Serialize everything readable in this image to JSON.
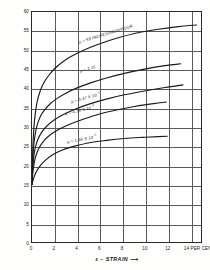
{
  "chart_data": {
    "type": "line",
    "title": "",
    "xlabel": "ε – STRAIN",
    "ylabel": "σ – TRUE STRESS IN THOUSAND LBS/INCH",
    "ylabel_sup": "2",
    "xlabel_arrow": "⟶",
    "ylabel_arrow": "⟶",
    "xlim": [
      0,
      15
    ],
    "ylim": [
      0,
      60
    ],
    "xticks": [
      0,
      2,
      4,
      6,
      8,
      10,
      12,
      14
    ],
    "xtick_labels": [
      "0",
      "2",
      "4",
      "6",
      "8",
      "10",
      "12",
      "14 PER CENT"
    ],
    "yticks": [
      0,
      5,
      10,
      15,
      20,
      25,
      30,
      35,
      40,
      45,
      50,
      55,
      60
    ],
    "ytick_labels": [
      "0",
      "5",
      "10",
      "15",
      "20",
      "25",
      "30",
      "35",
      "40",
      "45",
      "50",
      "55",
      "60"
    ],
    "grid": true,
    "grid_color": "#5a5a5a",
    "curve_color": "#1a1a1a",
    "legend_position": "inline-annotations",
    "series": [
      {
        "name": "mu-59",
        "label": "μ = 59 INCHES/INCH/HOUR",
        "label_x": 4.2,
        "label_y": 52.0,
        "label_rotation": -17,
        "x": [
          0,
          0.05,
          0.12,
          0.25,
          0.45,
          0.75,
          1.1,
          1.5,
          2.0,
          2.6,
          3.3,
          4.2,
          5.2,
          6.4,
          7.8,
          9.4,
          11.2,
          13.0,
          14.6
        ],
        "y": [
          15.0,
          22.0,
          27.5,
          32.5,
          36.5,
          39.6,
          41.8,
          43.5,
          45.2,
          46.7,
          48.1,
          49.5,
          50.8,
          52.1,
          53.4,
          54.6,
          55.5,
          56.2,
          56.6
        ]
      },
      {
        "name": "mu-2.15",
        "label": "μ = 2.15",
        "label_x": 4.3,
        "label_y": 44.4,
        "label_rotation": -16,
        "x": [
          0,
          0.05,
          0.12,
          0.25,
          0.45,
          0.75,
          1.1,
          1.6,
          2.2,
          3.0,
          4.0,
          5.2,
          6.6,
          8.2,
          10.0,
          11.8,
          13.2
        ],
        "y": [
          15.0,
          20.0,
          24.0,
          27.5,
          30.4,
          32.8,
          34.4,
          36.0,
          37.4,
          38.8,
          40.2,
          41.5,
          42.8,
          44.0,
          45.1,
          46.0,
          46.5
        ]
      },
      {
        "name": "mu-0.47e-1",
        "label": "μ = 0.47 X 10",
        "label_sup": "−1",
        "label_x": 3.5,
        "label_y": 36.6,
        "label_rotation": -15,
        "x": [
          0,
          0.05,
          0.12,
          0.25,
          0.5,
          0.85,
          1.3,
          1.9,
          2.7,
          3.7,
          5.0,
          6.5,
          8.2,
          10.0,
          11.8,
          13.4
        ],
        "y": [
          15.0,
          18.4,
          21.2,
          24.0,
          26.6,
          28.6,
          30.2,
          31.7,
          33.1,
          34.5,
          35.9,
          37.2,
          38.4,
          39.4,
          40.3,
          41.0
        ]
      },
      {
        "name": "mu-4.28e-3",
        "label": "μ = 4.28 X 10",
        "label_sup": "−3",
        "label_x": 3.0,
        "label_y": 33.5,
        "label_rotation": -13,
        "x": [
          0,
          0.05,
          0.14,
          0.3,
          0.6,
          1.0,
          1.6,
          2.4,
          3.4,
          4.6,
          6.0,
          7.6,
          9.2,
          10.8,
          11.9
        ],
        "y": [
          15.0,
          17.3,
          19.6,
          22.0,
          24.4,
          26.2,
          27.9,
          29.4,
          30.8,
          32.1,
          33.4,
          34.5,
          35.4,
          36.1,
          36.5
        ]
      },
      {
        "name": "mu-1.66e-5",
        "label": "μ = 1.66 X 10",
        "label_sup": "−5",
        "label_x": 3.2,
        "label_y": 26.3,
        "label_rotation": -10,
        "x": [
          0,
          0.1,
          0.3,
          0.6,
          1.1,
          1.8,
          2.7,
          3.8,
          5.1,
          6.6,
          8.2,
          9.8,
          11.2,
          12.0
        ],
        "y": [
          15.0,
          16.2,
          17.8,
          19.4,
          21.1,
          22.7,
          24.0,
          25.0,
          25.9,
          26.5,
          27.0,
          27.3,
          27.5,
          27.6
        ]
      }
    ]
  }
}
